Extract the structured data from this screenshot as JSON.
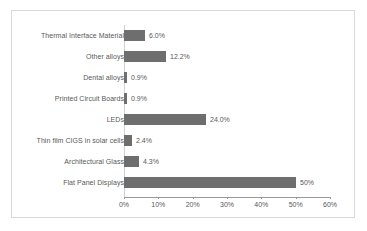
{
  "chart_data": {
    "type": "bar",
    "orientation": "horizontal",
    "title": "",
    "xlabel": "",
    "ylabel": "",
    "grid": false,
    "legend": null,
    "xlim": [
      0,
      60
    ],
    "xticks": [
      "0%",
      "10%",
      "20%",
      "30%",
      "40%",
      "50%",
      "60%"
    ],
    "xtick_values": [
      0,
      10,
      20,
      30,
      40,
      50,
      60
    ],
    "categories": [
      "Thermal Interface Material",
      "Other alloys",
      "Dental alloys",
      "Printed Circuit Boards",
      "LEDs",
      "Thin film CIGS in solar cells",
      "Architectural Glass",
      "Flat Panel Displays"
    ],
    "values": [
      6.0,
      12.2,
      0.9,
      0.9,
      24.0,
      2.4,
      4.3,
      50
    ],
    "data_labels": [
      "6.0%",
      "12.2%",
      "0.9%",
      "0.9%",
      "24.0%",
      "2.4%",
      "4.3%",
      "50%"
    ],
    "bar_color": "#6e6e6e",
    "axis_color": "#9a9a9a",
    "text_color": "#595959",
    "border_color": "#d9d9d9",
    "background_color": "#ffffff"
  }
}
